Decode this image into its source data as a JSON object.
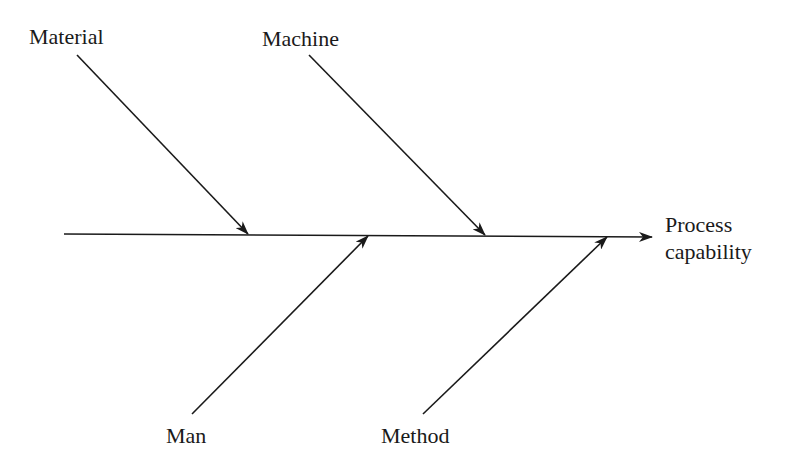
{
  "diagram": {
    "type": "fishbone",
    "effect": {
      "line1": "Process",
      "line2": "capability"
    },
    "causes": [
      {
        "id": "material",
        "label": "Material",
        "position": "top"
      },
      {
        "id": "machine",
        "label": "Machine",
        "position": "top"
      },
      {
        "id": "man",
        "label": "Man",
        "position": "bottom"
      },
      {
        "id": "method",
        "label": "Method",
        "position": "bottom"
      }
    ],
    "line_color": "#1a1a1a"
  }
}
